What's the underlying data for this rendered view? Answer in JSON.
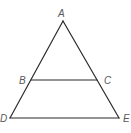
{
  "diagram": {
    "type": "geometry-triangle",
    "stroke_color": "#2b2b2b",
    "label_color": "#5a5a5a",
    "points": {
      "A": {
        "x": 63,
        "y": 21
      },
      "B": {
        "x": 31,
        "y": 80
      },
      "C": {
        "x": 97,
        "y": 80
      },
      "D": {
        "x": 10,
        "y": 118
      },
      "E": {
        "x": 119,
        "y": 118
      }
    },
    "segments": [
      {
        "from": "A",
        "to": "D"
      },
      {
        "from": "A",
        "to": "E"
      },
      {
        "from": "B",
        "to": "C"
      },
      {
        "from": "D",
        "to": "E"
      }
    ],
    "labels": {
      "A": "A",
      "B": "B",
      "C": "C",
      "D": "D",
      "E": "E"
    }
  }
}
